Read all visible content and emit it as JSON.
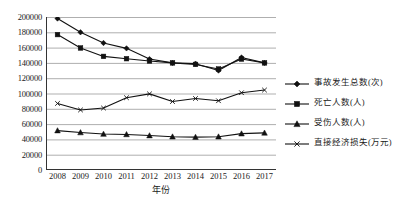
{
  "chart_data": {
    "type": "line",
    "title": "",
    "xlabel": "年份",
    "ylabel": "",
    "grid": true,
    "legend_position": "right",
    "categories": [
      "2008",
      "2009",
      "2010",
      "2011",
      "2012",
      "2013",
      "2014",
      "2015",
      "2016",
      "2017"
    ],
    "ylim": [
      0,
      200000
    ],
    "yticks": [
      "0",
      "20000",
      "40000",
      "60000",
      "80000",
      "100000",
      "120000",
      "140000",
      "160000",
      "180000",
      "200000"
    ],
    "ytick_values": [
      0,
      20000,
      40000,
      60000,
      80000,
      100000,
      120000,
      140000,
      160000,
      180000,
      200000
    ],
    "series": [
      {
        "name": "事故发生总数(次)",
        "marker": "diamond",
        "color": "#111111",
        "values": [
          198000,
          180000,
          166000,
          159000,
          145000,
          140000,
          139000,
          130000,
          147000,
          140000
        ]
      },
      {
        "name": "死亡人数(人)",
        "marker": "square",
        "color": "#111111",
        "values": [
          177000,
          159500,
          148500,
          145500,
          142500,
          140000,
          138000,
          132000,
          145000,
          140000
        ]
      },
      {
        "name": "受伤人数(人)",
        "marker": "triangle",
        "color": "#111111",
        "values": [
          51500,
          49000,
          47000,
          46500,
          45000,
          43500,
          43000,
          43500,
          47500,
          48500
        ]
      },
      {
        "name": "直接经济损失(万元)",
        "marker": "cross",
        "color": "#111111",
        "values": [
          87000,
          78500,
          81000,
          94500,
          99500,
          89500,
          93500,
          90500,
          101000,
          104500
        ]
      }
    ]
  },
  "legend": {
    "items": [
      {
        "label": "事故发生总数(次)",
        "marker": "diamond"
      },
      {
        "label": "死亡人数(人)",
        "marker": "square"
      },
      {
        "label": "受伤人数(人)",
        "marker": "triangle"
      },
      {
        "label": "直接经济损失(万元)",
        "marker": "cross"
      }
    ]
  }
}
